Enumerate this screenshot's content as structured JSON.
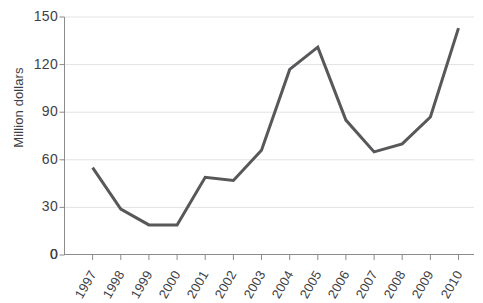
{
  "chart_data": {
    "type": "line",
    "title": "",
    "xlabel": "",
    "ylabel": "Million dollars",
    "categories": [
      "1997",
      "1998",
      "1999",
      "2000",
      "2001",
      "2002",
      "2003",
      "2004",
      "2005",
      "2006",
      "2007",
      "2008",
      "2009",
      "2010"
    ],
    "values": [
      55,
      29,
      19,
      19,
      49,
      47,
      66,
      117,
      131,
      85,
      65,
      70,
      87,
      143
    ],
    "series": [
      {
        "name": "Value",
        "values": [
          55,
          29,
          19,
          19,
          49,
          47,
          66,
          117,
          131,
          85,
          65,
          70,
          87,
          143
        ]
      }
    ],
    "ylim": [
      0,
      150
    ],
    "y_ticks": [
      0,
      30,
      60,
      90,
      120,
      150
    ],
    "y_tick_labels": [
      "0",
      "30",
      "60",
      "90",
      "120",
      "150"
    ],
    "grid": "horizontal",
    "legend": "none",
    "line_color": "#58585b",
    "grid_color": "#e3e3e6",
    "axis_color": "#8a8a8f",
    "text_color": "#3f3f46"
  },
  "axes": {
    "y_title": "Million dollars",
    "zero_label": "0"
  }
}
